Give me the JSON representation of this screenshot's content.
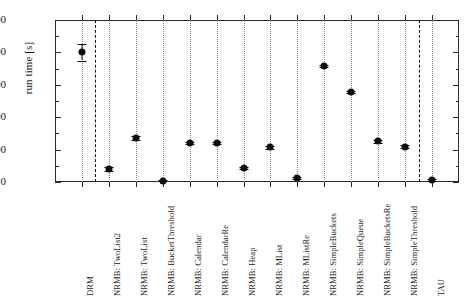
{
  "chart_data": {
    "type": "scatter",
    "title": "",
    "xlabel": "",
    "ylabel": "run time [s]",
    "ylim": [
      0,
      1000
    ],
    "yticks": [
      0,
      200,
      400,
      600,
      800,
      1000
    ],
    "ytick_labels": [
      "0",
      "200",
      "400",
      "600",
      "800",
      "1000"
    ],
    "y_minor_ticks": [
      100,
      300,
      500,
      700,
      900
    ],
    "grid": "vertical dotted gridlines at each category",
    "legend": "none",
    "separators": [
      "after DRM",
      "before TAU"
    ],
    "categories": [
      "DRM",
      "NRMB: TwoList2",
      "NRMB: TwoList",
      "NRMB: BucketThreshold",
      "NRMB: Calendar",
      "NRMB: CalendarRe",
      "NRMB: Heap",
      "NRMB: MList",
      "NRMB: MListRe",
      "NRMB: SimpleBuckets",
      "NRMB: SimpleQueue",
      "NRMB: SimpleBucketsRe",
      "NRMB: SimpleThreshold",
      "TAU"
    ],
    "values": [
      802,
      80,
      272,
      8,
      241,
      241,
      86,
      213,
      25,
      716,
      556,
      251,
      218,
      12
    ],
    "errors": [
      52,
      14,
      10,
      4,
      8,
      8,
      6,
      8,
      5,
      9,
      8,
      8,
      8,
      5
    ]
  },
  "axis": {
    "y_title": "run time [s]"
  }
}
